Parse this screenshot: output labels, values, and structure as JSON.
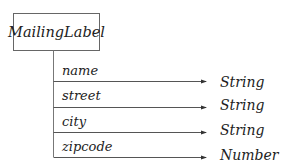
{
  "diagram": {
    "root": {
      "label": "MailingLabel"
    },
    "attributes": [
      {
        "name": "name",
        "type": "String"
      },
      {
        "name": "street",
        "type": "String"
      },
      {
        "name": "city",
        "type": "String"
      },
      {
        "name": "zipcode",
        "type": "Number"
      }
    ]
  },
  "colors": {
    "line": "#555555",
    "text": "#222222",
    "background": "#ffffff"
  }
}
